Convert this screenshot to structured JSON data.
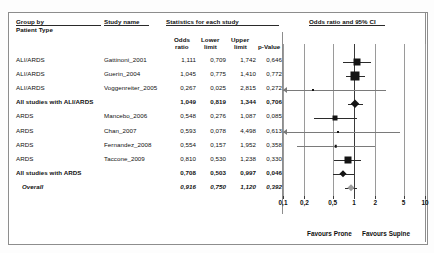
{
  "headers": {
    "group_by": "Group by",
    "group_by_sub": "Patient Type",
    "study_name": "Study name",
    "statistics": "Statistics for each study",
    "plot_title": "Odds ratio and 95% CI",
    "odds_ratio": "Odds",
    "odds_ratio2": "ratio",
    "lower": "Lower",
    "lower2": "limit",
    "upper": "Upper",
    "upper2": "limit",
    "pvalue": "p-Value"
  },
  "rows": [
    {
      "group": "ALI/ARDS",
      "study": "Gattinoni_2001",
      "or": "1,111",
      "lower": "0,709",
      "upper": "1,742",
      "p": "0,646",
      "bold": false,
      "italic": false,
      "marker": "square",
      "or_v": 1.111,
      "lo_v": 0.709,
      "hi_v": 1.742,
      "size": 7
    },
    {
      "group": "ALI/ARDS",
      "study": "Guerin_2004",
      "or": "1,045",
      "lower": "0,775",
      "upper": "1,410",
      "p": "0,772",
      "bold": false,
      "italic": false,
      "marker": "square",
      "or_v": 1.045,
      "lo_v": 0.775,
      "hi_v": 1.41,
      "size": 9
    },
    {
      "group": "ALI/ARDS",
      "study": "Voggenreiter_2005",
      "or": "0,267",
      "lower": "0,025",
      "upper": "2,815",
      "p": "0,272",
      "bold": false,
      "italic": false,
      "marker": "dot",
      "or_v": 0.267,
      "lo_v": 0.025,
      "hi_v": 2.815,
      "size": 2,
      "clip_low": true
    },
    {
      "group": "All studies with ALI/ARDS",
      "study": "",
      "or": "1,049",
      "lower": "0,819",
      "upper": "1,344",
      "p": "0,706",
      "bold": true,
      "italic": false,
      "marker": "diamond",
      "or_v": 1.049,
      "lo_v": 0.819,
      "hi_v": 1.344,
      "size": 8
    },
    {
      "group": "ARDS",
      "study": "Mancebo_2006",
      "or": "0,548",
      "lower": "0,276",
      "upper": "1,087",
      "p": "0,085",
      "bold": false,
      "italic": false,
      "marker": "square",
      "or_v": 0.548,
      "lo_v": 0.276,
      "hi_v": 1.087,
      "size": 5
    },
    {
      "group": "ARDS",
      "study": "Chan_2007",
      "or": "0,593",
      "lower": "0,078",
      "upper": "4,498",
      "p": "0,613",
      "bold": false,
      "italic": false,
      "marker": "dot",
      "or_v": 0.593,
      "lo_v": 0.078,
      "hi_v": 4.498,
      "size": 2,
      "clip_low": true
    },
    {
      "group": "ARDS",
      "study": "Fernandez_2008",
      "or": "0,554",
      "lower": "0,157",
      "upper": "1,952",
      "p": "0,358",
      "bold": false,
      "italic": false,
      "marker": "dot",
      "or_v": 0.554,
      "lo_v": 0.157,
      "hi_v": 1.952,
      "size": 2.5
    },
    {
      "group": "ARDS",
      "study": "Taccone_2009",
      "or": "0,810",
      "lower": "0,530",
      "upper": "1,238",
      "p": "0,330",
      "bold": false,
      "italic": false,
      "marker": "square",
      "or_v": 0.81,
      "lo_v": 0.53,
      "hi_v": 1.238,
      "size": 7
    },
    {
      "group": "All studies with ARDS",
      "study": "",
      "or": "0,708",
      "lower": "0,503",
      "upper": "0,997",
      "p": "0,046",
      "bold": true,
      "italic": false,
      "marker": "diamond",
      "or_v": 0.708,
      "lo_v": 0.503,
      "hi_v": 0.997,
      "size": 7
    },
    {
      "group": "Overall",
      "study": "",
      "or": "0,916",
      "lower": "0,750",
      "upper": "1,120",
      "p": "0,392",
      "bold": false,
      "italic": true,
      "marker": "diamond-grey",
      "or_v": 0.916,
      "lo_v": 0.75,
      "hi_v": 1.12,
      "size": 7
    }
  ],
  "axis": {
    "ticks": [
      "0,1",
      "0,2",
      "0,5",
      "1",
      "2",
      "5",
      "10"
    ],
    "values": [
      0.1,
      0.2,
      0.5,
      1,
      2,
      5,
      10
    ]
  },
  "footer": {
    "left": "Favours Prone",
    "right": "Favours Supine"
  },
  "chart_data": {
    "type": "forest",
    "title": "Odds ratio and 95% CI",
    "xlabel": "Odds ratio (log scale)",
    "xlim": [
      0.1,
      10
    ],
    "xscale": "log",
    "ticks": [
      0.1,
      0.2,
      0.5,
      1,
      2,
      5,
      10
    ],
    "reference_line": 1,
    "favours_left": "Favours Prone",
    "favours_right": "Favours Supine",
    "studies": [
      {
        "group": "ALI/ARDS",
        "study": "Gattinoni_2001",
        "odds_ratio": 1.111,
        "lower_limit": 0.709,
        "upper_limit": 1.742,
        "p_value": 0.646
      },
      {
        "group": "ALI/ARDS",
        "study": "Guerin_2004",
        "odds_ratio": 1.045,
        "lower_limit": 0.775,
        "upper_limit": 1.41,
        "p_value": 0.772
      },
      {
        "group": "ALI/ARDS",
        "study": "Voggenreiter_2005",
        "odds_ratio": 0.267,
        "lower_limit": 0.025,
        "upper_limit": 2.815,
        "p_value": 0.272
      },
      {
        "group": "ALI/ARDS",
        "study": "All studies with ALI/ARDS",
        "odds_ratio": 1.049,
        "lower_limit": 0.819,
        "upper_limit": 1.344,
        "p_value": 0.706,
        "summary": true
      },
      {
        "group": "ARDS",
        "study": "Mancebo_2006",
        "odds_ratio": 0.548,
        "lower_limit": 0.276,
        "upper_limit": 1.087,
        "p_value": 0.085
      },
      {
        "group": "ARDS",
        "study": "Chan_2007",
        "odds_ratio": 0.593,
        "lower_limit": 0.078,
        "upper_limit": 4.498,
        "p_value": 0.613
      },
      {
        "group": "ARDS",
        "study": "Fernandez_2008",
        "odds_ratio": 0.554,
        "lower_limit": 0.157,
        "upper_limit": 1.952,
        "p_value": 0.358
      },
      {
        "group": "ARDS",
        "study": "Taccone_2009",
        "odds_ratio": 0.81,
        "lower_limit": 0.53,
        "upper_limit": 1.238,
        "p_value": 0.33
      },
      {
        "group": "ARDS",
        "study": "All studies with ARDS",
        "odds_ratio": 0.708,
        "lower_limit": 0.503,
        "upper_limit": 0.997,
        "p_value": 0.046,
        "summary": true
      },
      {
        "group": "Overall",
        "study": "Overall",
        "odds_ratio": 0.916,
        "lower_limit": 0.75,
        "upper_limit": 1.12,
        "p_value": 0.392,
        "summary": true
      }
    ]
  }
}
